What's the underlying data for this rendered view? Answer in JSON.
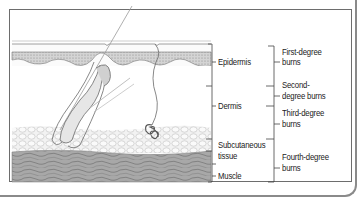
{
  "diagram": {
    "layers": [
      {
        "id": "epidermis",
        "label": "Epidermis"
      },
      {
        "id": "dermis",
        "label": "Dermis"
      },
      {
        "id": "subcutaneous",
        "label_line1": "Subcutaneous",
        "label_line2": "tissue"
      },
      {
        "id": "muscle",
        "label": "Muscle"
      }
    ],
    "burns": [
      {
        "id": "first",
        "label_line1": "First-degree",
        "label_line2": "burns"
      },
      {
        "id": "second",
        "label_line1": "Second-",
        "label_line2": "degree burns"
      },
      {
        "id": "third",
        "label_line1": "Third-degree",
        "label_line2": "burns"
      },
      {
        "id": "fourth",
        "label_line1": "Fourth-degree",
        "label_line2": "burns"
      }
    ],
    "colors": {
      "frame": "#6d6d6d",
      "ink": "#222222",
      "epidermis_fill": "#c9c9c9",
      "fat_fill": "#f1f1f1",
      "muscle_fill": "#9a9a9a"
    }
  }
}
